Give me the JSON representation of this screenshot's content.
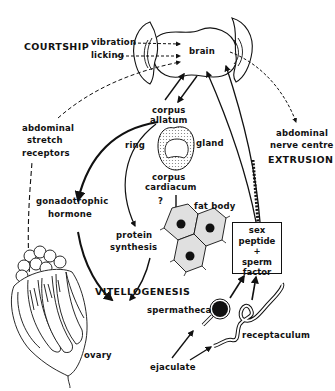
{
  "figure": {
    "type": "biological process diagram"
  },
  "labels": {
    "courtship": "COURTSHIP",
    "vibration": "vibration",
    "licking": "licking",
    "brain": "brain",
    "corpus_allatum_1": "corpus",
    "corpus_allatum_2": "allatum",
    "ring": "ring",
    "gland": "gland",
    "corpus_cardiacum_1": "corpus",
    "corpus_cardiacum_2": "cardiacum",
    "question": "?",
    "fat_body": "fat body",
    "abdominal_stretch_1": "abdominal",
    "abdominal_stretch_2": "stretch",
    "abdominal_stretch_3": "receptors",
    "abdominal_nerve_1": "abdominal",
    "abdominal_nerve_2": "nerve centre",
    "extrusion": "EXTRUSION",
    "gonadotrophic_1": "gonadotrophic",
    "gonadotrophic_2": "hormone",
    "protein_1": "protein",
    "protein_2": "synthesis",
    "vitellogenesis": "VITELLOGENESIS",
    "spermatheca": "spermatheca",
    "receptaculum": "receptaculum",
    "ejaculate": "ejaculate",
    "ovary": "ovary"
  },
  "box": {
    "line1": "sex",
    "line2": "peptide",
    "line3": "+",
    "line4": "sperm",
    "line5": "factor"
  },
  "colors": {
    "ink": "#111111",
    "background": "#ffffff",
    "stipple": "#cfcfcf"
  }
}
